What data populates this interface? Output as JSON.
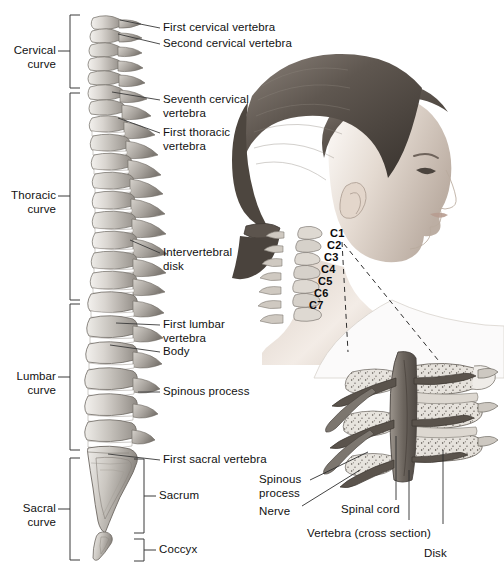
{
  "figure": {
    "background_color": "#ffffff",
    "width": 504,
    "height": 568
  },
  "curve_brackets": [
    {
      "id": "cervical",
      "label": "Cervical\ncurve"
    },
    {
      "id": "thoracic",
      "label": "Thoracic\ncurve"
    },
    {
      "id": "lumbar",
      "label": "Lumbar\ncurve"
    },
    {
      "id": "sacral",
      "label": "Sacral\ncurve"
    }
  ],
  "spine_labels": [
    {
      "id": "first-cervical-vertebra",
      "text": "First cervical vertebra"
    },
    {
      "id": "second-cervical-vertebra",
      "text": "Second cervical vertebra"
    },
    {
      "id": "seventh-cervical-vertebra",
      "text": "Seventh cervical\nvertebra"
    },
    {
      "id": "first-thoracic-vertebra",
      "text": "First thoracic\nvertebra"
    },
    {
      "id": "intervertebral-disk",
      "text": "Intervertebral\ndisk"
    },
    {
      "id": "first-lumbar-vertebra",
      "text": "First lumbar\nvertebra"
    },
    {
      "id": "body",
      "text": "Body"
    },
    {
      "id": "spinous-process",
      "text": "Spinous process"
    },
    {
      "id": "first-sacral-vertebra",
      "text": "First sacral vertebra"
    }
  ],
  "region_brackets": [
    {
      "id": "sacrum",
      "text": "Sacrum"
    },
    {
      "id": "coccyx",
      "text": "Coccyx"
    }
  ],
  "cervical_vertebrae": [
    {
      "id": "c1",
      "text": "C1"
    },
    {
      "id": "c2",
      "text": "C2"
    },
    {
      "id": "c3",
      "text": "C3"
    },
    {
      "id": "c4",
      "text": "C4"
    },
    {
      "id": "c5",
      "text": "C5"
    },
    {
      "id": "c6",
      "text": "C6"
    },
    {
      "id": "c7",
      "text": "C7"
    }
  ],
  "cross_section_labels": [
    {
      "id": "spinous-process-cs",
      "text": "Spinous\nprocess"
    },
    {
      "id": "nerve",
      "text": "Nerve"
    },
    {
      "id": "spinal-cord",
      "text": "Spinal cord"
    },
    {
      "id": "vertebra-cs",
      "text": "Vertebra (cross section)"
    },
    {
      "id": "disk",
      "text": "Disk"
    }
  ],
  "colors": {
    "line": "#3a3a3a",
    "text": "#111111",
    "bone_light": "#e8e6e2",
    "bone_mid": "#bdb9b3",
    "bone_dark": "#8d8882",
    "disk": "#ffffff",
    "skin_light": "#efe9e4",
    "skin_mid": "#c9bdb3",
    "hair_dark": "#6a625c",
    "cord": "#6e6862"
  }
}
